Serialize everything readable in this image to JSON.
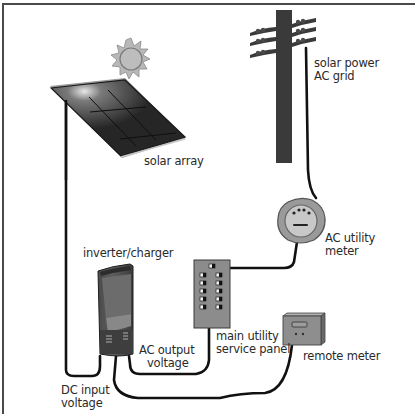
{
  "diagram": {
    "labels": {
      "solar_array": "solar array",
      "grid_line1": "solar power",
      "grid_line2": "AC grid",
      "utility_meter_line1": "AC utility",
      "utility_meter_line2": "meter",
      "inverter": "inverter/charger",
      "panel_line1": "main utility",
      "panel_line2": "service panel",
      "ac_output_line1": "AC output",
      "ac_output_line2": "voltage",
      "remote_meter": "remote meter",
      "dc_input_line1": "DC input",
      "dc_input_line2": "voltage"
    },
    "components": [
      {
        "id": "sun",
        "icon": "sun-icon"
      },
      {
        "id": "solar-array",
        "icon": "solar-panel-icon"
      },
      {
        "id": "utility-pole",
        "icon": "utility-pole-icon"
      },
      {
        "id": "ac-utility-meter",
        "icon": "meter-icon"
      },
      {
        "id": "inverter-charger",
        "icon": "inverter-icon"
      },
      {
        "id": "main-service-panel",
        "icon": "breaker-panel-icon"
      },
      {
        "id": "remote-meter",
        "icon": "remote-meter-icon"
      }
    ],
    "colors": {
      "frame": "#4a4a4a",
      "wire": "#111111",
      "panel": "#2b2b2b",
      "sun": "#b5b5b5",
      "device_gray": "#8a8a8a",
      "text": "#2a2a2a"
    }
  }
}
